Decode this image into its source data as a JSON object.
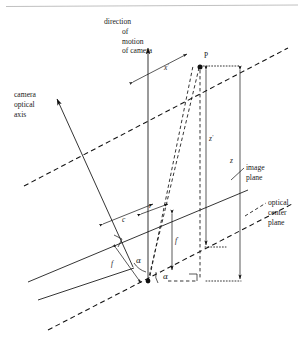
{
  "figure": {
    "type": "technical-line-diagram",
    "width": 304,
    "height": 341,
    "background": "#ffffff",
    "line_color": "#111111",
    "rule_color": "#b9b9b9"
  },
  "labels": {
    "motion_line_1": "direction",
    "motion_line_2": "of",
    "motion_line_3": "motion",
    "motion_line_4": "of camera",
    "axis_line_1": "camera",
    "axis_line_2": "optical",
    "axis_line_3": "axis",
    "image_plane_line_1": "image",
    "image_plane_line_2": "plane",
    "center_plane_line_1": "optical",
    "center_plane_line_2": "center",
    "center_plane_line_3": "plane"
  },
  "symbols": {
    "point_p": "P",
    "x_prime": "x",
    "x_prime_mark": "'",
    "z_prime": "z",
    "z_prime_mark": "'",
    "z": "z",
    "f_prime": "f",
    "f_prime_mark": "'",
    "f": "f",
    "c": "c",
    "r": "r",
    "alpha_upper": "α",
    "alpha_lower": "α"
  },
  "geometry": {
    "scene_point": {
      "x": 200,
      "y": 64
    },
    "camera_center": {
      "x": 148,
      "y": 281
    },
    "image_point": {
      "x": 172,
      "y": 255
    },
    "motion_axis": {
      "x": 148,
      "y_top": 46,
      "y_bottom": 282
    },
    "image_plane": {
      "x1": 28,
      "y1": 282,
      "x2": 248,
      "y2": 190
    },
    "optical_axis_tip": {
      "x": 57,
      "y": 99
    },
    "optical_axis_tail": {
      "x": 132,
      "y": 266
    }
  }
}
